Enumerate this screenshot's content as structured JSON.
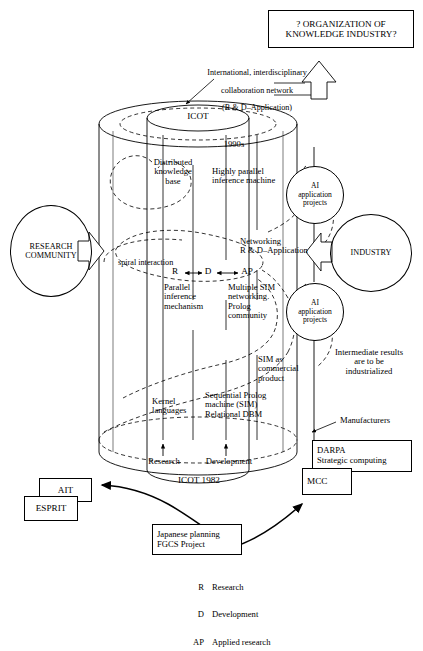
{
  "diagram": {
    "title_box": {
      "line1": "? ORGANIZATION OF",
      "line2": "KNOWLEDGE INDUSTRY?"
    },
    "top_annotation": {
      "line1": "International, interdisciplinary",
      "line2": "collaboration network",
      "line3": "(R & D–Application)"
    },
    "cylinder": {
      "top_label": "ICOT",
      "bottom_label": "ICOT 1982",
      "era_label": "1990s"
    },
    "inner_labels": {
      "distributed_knowledge_base": "Distributed\nknowledge\nbase",
      "highly_parallel_inference_machine": "Highly parallel\ninference machine",
      "spiral_interaction": "spiral interaction",
      "rd_ap_chain": "R ↔ D ↔ AP",
      "networking": "Networking\nR & D–Application",
      "parallel_inference_mechanism": "Parallel\ninference\nmechanism",
      "multiple_sim": "Multiple SIM\nnetworking.\nProlog\ncommunity",
      "sim_as_commercial_product": "SIM as\ncommercial\nproduct",
      "kernel_languages": "Kernel\nlanguages",
      "sequential_prolog": "Sequential Prolog\nmachine (SIM)\nRelational DBM",
      "research": "Research",
      "development": "Development"
    },
    "circles": [
      {
        "name": "research-community",
        "label": "RESEARCH\nCOMMUNITY"
      },
      {
        "name": "ai-application-projects-upper",
        "label": "AI\napplication\nprojects"
      },
      {
        "name": "ai-application-projects-lower",
        "label": "AI\napplication\nprojects"
      },
      {
        "name": "industry",
        "label": "INDUSTRY"
      }
    ],
    "side_annotations": {
      "intermediate_results": "Intermediate results\nare to be\nindustrialized",
      "manufacturers": "Manufacturers"
    },
    "boxes": [
      {
        "name": "ait",
        "label": "AIT"
      },
      {
        "name": "esprit",
        "label": "ESPRIT"
      },
      {
        "name": "darpa",
        "label": "DARPA\nStrategic computing"
      },
      {
        "name": "mcc",
        "label": "MCC"
      },
      {
        "name": "japanese-planning",
        "label": "Japanese planning\nFGCS Project"
      }
    ],
    "legend": [
      {
        "key": "R",
        "desc": "Research"
      },
      {
        "key": "D",
        "desc": "Development"
      },
      {
        "key": "AP",
        "desc": "Applied research"
      }
    ],
    "colors": {
      "ink": "#000000",
      "paper": "#ffffff"
    }
  }
}
